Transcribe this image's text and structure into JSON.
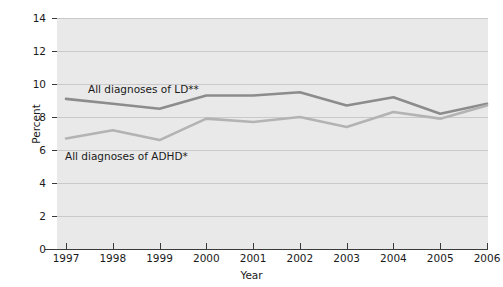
{
  "chart_data": {
    "type": "line",
    "title": "",
    "xlabel": "Year",
    "ylabel": "Percent",
    "x": [
      1997,
      1998,
      1999,
      2000,
      2001,
      2002,
      2003,
      2004,
      2005,
      2006
    ],
    "categories": [
      "1997",
      "1998",
      "1999",
      "2000",
      "2001",
      "2002",
      "2003",
      "2004",
      "2005",
      "2006"
    ],
    "xlim": [
      1997,
      2006
    ],
    "ylim": [
      0,
      14
    ],
    "yticks": [
      0,
      2,
      4,
      6,
      8,
      10,
      12,
      14
    ],
    "ytick_labels": [
      "0",
      "2",
      "4",
      "6",
      "8",
      "10",
      "12",
      "14"
    ],
    "xtick_labels": [
      "1997",
      "1998",
      "1999",
      "2000",
      "2001",
      "2002",
      "2003",
      "2004",
      "2005",
      "2006"
    ],
    "grid": "horizontal",
    "legend_position": "inline-annotation",
    "plot_background": "#e9e9e9",
    "series": [
      {
        "name": "All diagnoses of LD**",
        "color": "#8c8c8c",
        "values": [
          9.1,
          8.8,
          8.5,
          9.3,
          9.3,
          9.5,
          8.7,
          9.2,
          8.2,
          8.8
        ]
      },
      {
        "name": "All diagnoses of ADHD*",
        "color": "#b3b3b3",
        "values": [
          6.7,
          7.2,
          6.6,
          7.9,
          7.7,
          8.0,
          7.4,
          8.3,
          7.9,
          8.7
        ]
      }
    ],
    "annotations": [
      {
        "text": "All diagnoses of LD**",
        "series": "All diagnoses of LD**"
      },
      {
        "text": "All diagnoses of ADHD*",
        "series": "All diagnoses of ADHD*"
      }
    ]
  },
  "axis": {
    "y_title": "Percent",
    "x_title": "Year"
  }
}
